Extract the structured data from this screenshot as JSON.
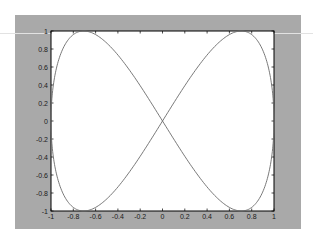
{
  "chart_data": {
    "type": "line",
    "title": "",
    "xlabel": "",
    "ylabel": "",
    "xlim": [
      -1,
      1
    ],
    "ylim": [
      -1,
      1
    ],
    "grid": false,
    "legend": null,
    "x_ticks": [
      "-1",
      "-0.8",
      "-0.6",
      "-0.4",
      "-0.2",
      "0",
      "0.2",
      "0.4",
      "0.6",
      "0.8",
      "1"
    ],
    "y_ticks": [
      "-1",
      "-0.8",
      "-0.6",
      "-0.4",
      "-0.2",
      "0",
      "0.2",
      "0.4",
      "0.6",
      "0.8",
      "1"
    ],
    "series": [
      {
        "name": "x = sin(t), y = sin(2t)",
        "description": "Lissajous figure-eight crossing at origin; y peaks at 1 near x=±0.707, y=-1 near x=±0.707, meets x=±1 at y=0",
        "x": [
          0,
          0.259,
          0.5,
          0.707,
          0.866,
          0.966,
          1,
          0.966,
          0.866,
          0.707,
          0.5,
          0.259,
          0,
          -0.259,
          -0.5,
          -0.707,
          -0.866,
          -0.966,
          -1,
          -0.966,
          -0.866,
          -0.707,
          -0.5,
          -0.259,
          0
        ],
        "y": [
          0,
          0.5,
          0.866,
          1,
          0.866,
          0.5,
          0,
          -0.5,
          -0.866,
          -1,
          -0.866,
          -0.5,
          0,
          0.5,
          0.866,
          1,
          0.866,
          0.5,
          0,
          -0.5,
          -0.866,
          -1,
          -0.866,
          -0.5,
          0
        ]
      }
    ]
  },
  "colors": {
    "figure_background": "#a9a9a9",
    "axes_background": "#ffffff",
    "line": "#6a6a6a",
    "axis": "#000000"
  }
}
